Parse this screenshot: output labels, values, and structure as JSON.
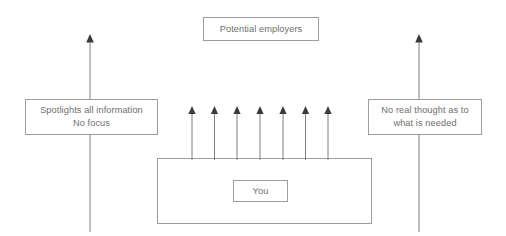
{
  "diagram": {
    "canvas": {
      "width": 506,
      "height": 236,
      "background": "#ffffff"
    },
    "colors": {
      "box_border": "#9c9c9c",
      "text": "#6e6e6e",
      "arrow_line": "#7f7f7f",
      "arrow_head": "#3a3a3a",
      "background": "#ffffff"
    },
    "nodes": {
      "potential_employers": {
        "label": "Potential employers"
      },
      "spotlights": {
        "label": "Spotlights all information\nNo focus"
      },
      "no_real_thought": {
        "label": "No real thought as to\nwhat is needed"
      },
      "you": {
        "label": "You"
      },
      "outer_container": {
        "label": ""
      }
    },
    "arrows": {
      "left_long": {
        "direction": "up",
        "length": 194,
        "head": "filled-triangle"
      },
      "right_long": {
        "direction": "up",
        "length": 194,
        "head": "filled-triangle"
      },
      "small_group": {
        "direction": "up",
        "count": 7,
        "length": 52,
        "head": "filled-triangle",
        "x_offsets": [
          12,
          34,
          57,
          80,
          103,
          125,
          148
        ]
      }
    }
  }
}
